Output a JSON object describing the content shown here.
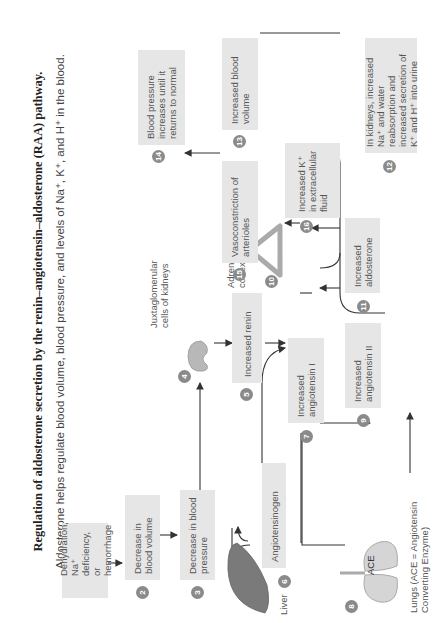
{
  "title": "Regulation of aldosterone secretion by the renin–angiotensin–aldosterone (RAA) pathway.",
  "subtitle": "Aldosterone helps regulate blood volume, blood pressure, and levels of Na⁺, K⁺, and H⁺ in the blood.",
  "steps": [
    {
      "num": "1",
      "text": "Dehydration, Na⁺ deficiency, or hemorrhage"
    },
    {
      "num": "2",
      "text": "Decrease in blood volume"
    },
    {
      "num": "3",
      "text": "Decrease in blood pressure"
    },
    {
      "num": "4",
      "text": "Juxtaglomerular cells of kidneys"
    },
    {
      "num": "5",
      "text": "Increased renin"
    },
    {
      "num": "6",
      "text": "Angiotensinogen"
    },
    {
      "num": "7",
      "text": "Increased angiotensin I"
    },
    {
      "num": "8",
      "text": "Lungs (ACE = Angiotensin Converting Enzyme)"
    },
    {
      "num": "9",
      "text": "Increased angiotensin II"
    },
    {
      "num": "10",
      "text": "Adrenal cortex"
    },
    {
      "num": "11",
      "text": "Increased aldosterone"
    },
    {
      "num": "12",
      "text": "In kidneys, increased Na⁺ and water reabsorption and increased secretion of K⁺ and H⁺ into urine"
    },
    {
      "num": "13",
      "text": "Increased blood volume"
    },
    {
      "num": "14",
      "text": "Blood pressure increases until it returns to normal"
    },
    {
      "num": "15",
      "text": "Vasoconstriction of arterioles"
    },
    {
      "num": "16",
      "text": "Increased K⁺ in extracellular fluid"
    }
  ],
  "labels": {
    "liver": "Liver",
    "ace": "ACE"
  },
  "colors": {
    "box_fill": "#e6e6e6",
    "number_badge": "#8a8a8a",
    "arrow": "#333333",
    "liver": "#7a7a7a",
    "organ": "#c8c8c8"
  }
}
